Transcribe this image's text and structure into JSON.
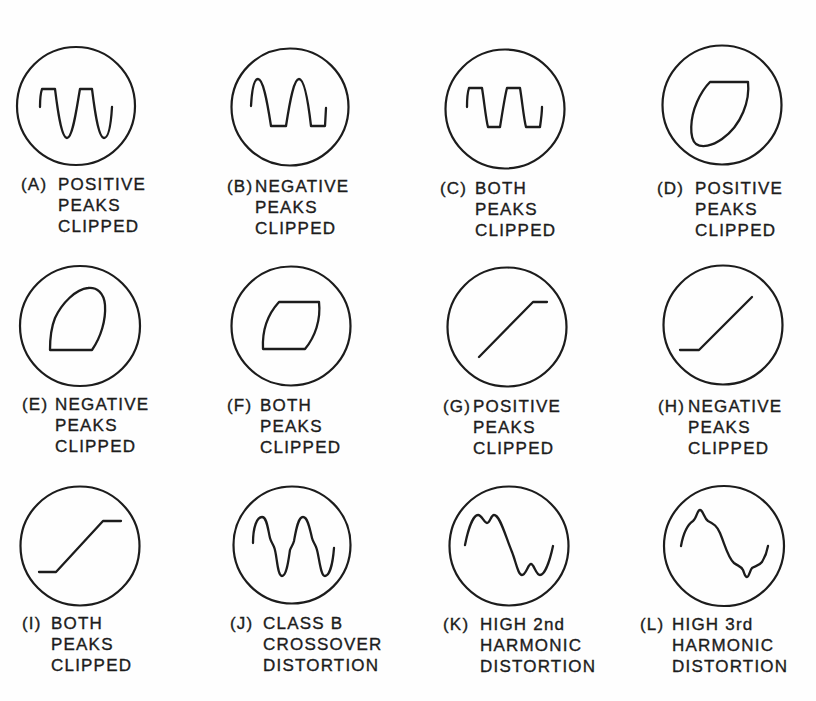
{
  "colors": {
    "ink": "#1c1c1c",
    "background": "#fefefe"
  },
  "figure": {
    "panels": [
      {
        "id": "A",
        "prefix": "(A)",
        "lines": [
          "POSITIVE",
          "PEAKS",
          "CLIPPED"
        ],
        "trace": "sine-wave-positive-peaks-clipped"
      },
      {
        "id": "B",
        "prefix": "(B)",
        "lines": [
          "NEGATIVE",
          "PEAKS",
          "CLIPPED"
        ],
        "trace": "sine-wave-negative-peaks-clipped"
      },
      {
        "id": "C",
        "prefix": "(C)",
        "lines": [
          "BOTH",
          "PEAKS",
          "CLIPPED"
        ],
        "trace": "sine-wave-both-peaks-clipped"
      },
      {
        "id": "D",
        "prefix": "(D)",
        "lines": [
          "POSITIVE",
          "PEAKS",
          "CLIPPED"
        ],
        "trace": "ellipse-top-flattened"
      },
      {
        "id": "E",
        "prefix": "(E)",
        "lines": [
          "NEGATIVE",
          "PEAKS",
          "CLIPPED"
        ],
        "trace": "ellipse-bottom-flattened"
      },
      {
        "id": "F",
        "prefix": "(F)",
        "lines": [
          "BOTH",
          "PEAKS",
          "CLIPPED"
        ],
        "trace": "ellipse-both-flattened"
      },
      {
        "id": "G",
        "prefix": "(G)",
        "lines": [
          "POSITIVE",
          "PEAKS",
          "CLIPPED"
        ],
        "trace": "transfer-line-top-flattened"
      },
      {
        "id": "H",
        "prefix": "(H)",
        "lines": [
          "NEGATIVE",
          "PEAKS",
          "CLIPPED"
        ],
        "trace": "transfer-line-bottom-flattened"
      },
      {
        "id": "I",
        "prefix": "(I)",
        "lines": [
          "BOTH",
          "PEAKS",
          "CLIPPED"
        ],
        "trace": "transfer-line-both-flattened"
      },
      {
        "id": "J",
        "prefix": "(J)",
        "lines": [
          "CLASS B",
          "CROSSOVER",
          "DISTORTION"
        ],
        "trace": "sine-wave-crossover-kinks"
      },
      {
        "id": "K",
        "prefix": "(K)",
        "lines": [
          "HIGH 2nd",
          "HARMONIC",
          "DISTORTION"
        ],
        "trace": "sine-wave-second-harmonic"
      },
      {
        "id": "L",
        "prefix": "(L)",
        "lines": [
          "HIGH 3rd",
          "HARMONIC",
          "DISTORTION"
        ],
        "trace": "sine-wave-third-harmonic"
      }
    ]
  }
}
